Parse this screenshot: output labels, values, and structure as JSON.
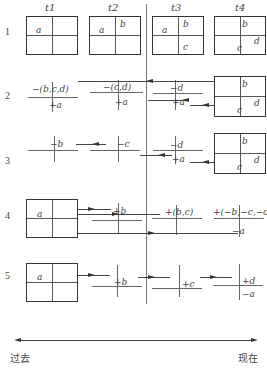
{
  "columns": [
    "t1",
    "t2",
    "t3",
    "t4"
  ],
  "rows": [
    {
      "number": "1",
      "boxes": [
        {
          "col": "t1",
          "cells": {
            "tl": "a",
            "tr": "",
            "bl": "",
            "br": ""
          }
        },
        {
          "col": "t2",
          "cells": {
            "tl": "a",
            "tr": "b",
            "bl": "",
            "br": ""
          }
        },
        {
          "col": "t3",
          "cells": {
            "tl": "a",
            "tr": "b",
            "bl": "",
            "br": "c"
          }
        },
        {
          "col": "t4",
          "cells": {
            "tl": "",
            "tr": "b",
            "bl": "c",
            "br": "d"
          }
        }
      ]
    },
    {
      "number": "2",
      "box": {
        "cells": {
          "tr": "b",
          "br": "d",
          "bc": "c"
        }
      },
      "nodes": [
        {
          "top": "−(b,c,d)",
          "bottom": "+a"
        },
        {
          "top": "−(c,d)",
          "bottom": "+a"
        },
        {
          "top": "−d",
          "bottom": "+a"
        }
      ]
    },
    {
      "number": "3",
      "box": {
        "cells": {
          "tr": "b",
          "br": "d",
          "bc": "c"
        }
      },
      "nodes": [
        {
          "top": "−b",
          "bottom": ""
        },
        {
          "top": "−c",
          "bottom": ""
        },
        {
          "top": "−d",
          "bottom": "+a"
        }
      ]
    },
    {
      "number": "4",
      "box": {
        "cells": {
          "tl": "a"
        }
      },
      "nodes": [
        {
          "top": "+b",
          "bottom": ""
        },
        {
          "top": "+(b,c)",
          "bottom": ""
        },
        {
          "top": "+(−b,−c,−d)",
          "bottom": "−a"
        }
      ]
    },
    {
      "number": "5",
      "box": {
        "cells": {
          "tl": "a"
        }
      },
      "nodes": [
        {
          "top": "+b",
          "bottom": ""
        },
        {
          "top": "+c",
          "bottom": ""
        },
        {
          "top": "+d",
          "bottom": "−a"
        }
      ]
    }
  ],
  "timeline": {
    "left": "过去",
    "right": "现在"
  }
}
